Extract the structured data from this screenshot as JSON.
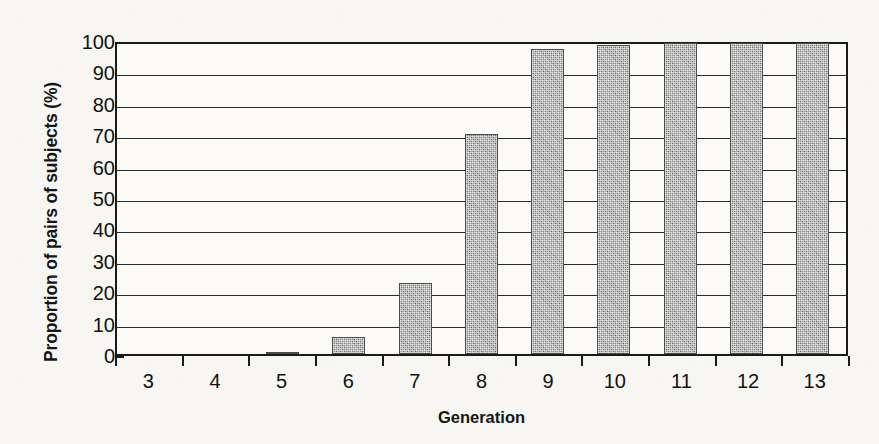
{
  "chart_data": {
    "type": "bar",
    "title": "",
    "xlabel": "Generation",
    "ylabel": "Proportion of pairs of subjects (%)",
    "categories": [
      "3",
      "4",
      "5",
      "6",
      "7",
      "8",
      "9",
      "10",
      "11",
      "12",
      "13"
    ],
    "values": [
      0,
      0,
      0.8,
      5.5,
      22.5,
      70,
      97,
      98.5,
      99,
      99,
      99
    ],
    "ylim": [
      0,
      100
    ],
    "yticks": [
      0,
      10,
      20,
      30,
      40,
      50,
      60,
      70,
      80,
      90,
      100
    ],
    "ytick_labels": [
      "0",
      "10",
      "20",
      "30",
      "40",
      "50",
      "60",
      "70",
      "80",
      "90",
      "100"
    ],
    "grid": "horizontal",
    "legend": "none",
    "bar_color": "#8b8b8b",
    "axis_color": "#1a1a1a",
    "background_color": "#f7f6f2"
  }
}
